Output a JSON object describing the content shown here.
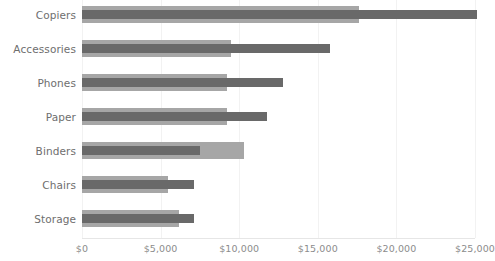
{
  "chart_data": {
    "type": "bar",
    "orientation": "horizontal",
    "title": "",
    "subtitle": "",
    "xlabel": "",
    "ylabel": "",
    "categories": [
      "Copiers",
      "Accessories",
      "Phones",
      "Paper",
      "Binders",
      "Chairs",
      "Storage"
    ],
    "series": [
      {
        "name": "outer",
        "color": "#a6a6a6",
        "values": [
          17600,
          9500,
          9200,
          9200,
          10300,
          5500,
          6200
        ]
      },
      {
        "name": "inner",
        "color": "#696969",
        "values": [
          25100,
          15800,
          12800,
          11800,
          7500,
          7100,
          7100
        ]
      }
    ],
    "xlim": [
      0,
      25000
    ],
    "xticks": [
      0,
      5000,
      10000,
      15000,
      20000,
      25000
    ],
    "xtick_labels": [
      "$0",
      "$5,000",
      "$10,000",
      "$15,000",
      "$20,000",
      "$25,000"
    ],
    "grid": true,
    "grid_axis": "x",
    "legend": "none",
    "legend_position": "none"
  },
  "colors": {
    "background": "#ffffff",
    "bar_outer": "#a6a6a6",
    "bar_inner": "#696969",
    "gridline": "#f2f2f2",
    "axis_line": "#e6e6e6",
    "category_label": "#6e6e6e",
    "tick_label": "#8c8c8c"
  }
}
